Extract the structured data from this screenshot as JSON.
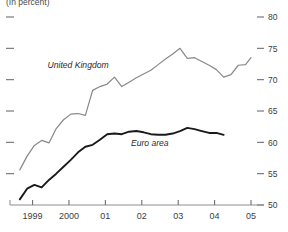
{
  "chart_data": {
    "type": "line",
    "title": "(In percent)",
    "subtitle": "",
    "xlabel": "",
    "ylabel": "",
    "unit_note": "(In percent)",
    "ylim": [
      50,
      80
    ],
    "xlim": [
      1998.6,
      2005.0
    ],
    "grid": false,
    "legend_position": "inline-annotations",
    "y_ticks": [
      50,
      55,
      60,
      65,
      70,
      75,
      80
    ],
    "y_tick_labels": [
      "50",
      "55",
      "60",
      "65",
      "70",
      "75",
      "80"
    ],
    "y_axis_side": "right",
    "y_ticks_mirrored_left": true,
    "x_ticks": [
      1999,
      2000,
      2001,
      2002,
      2003,
      2004,
      2005
    ],
    "x_tick_labels": [
      "1999",
      "2000",
      "01",
      "02",
      "03",
      "04",
      "05"
    ],
    "series": [
      {
        "name": "United Kingdom",
        "color": "#8a8a8a",
        "label_x": 2000.25,
        "label_y": 71.9,
        "x": [
          1998.65,
          1998.85,
          1999.05,
          1999.25,
          1999.45,
          1999.65,
          1999.85,
          2000.05,
          2000.25,
          2000.45,
          2000.65,
          2000.85,
          2001.05,
          2001.25,
          2001.45,
          2001.65,
          2001.85,
          2002.05,
          2002.25,
          2002.45,
          2002.65,
          2002.85,
          2003.05,
          2003.25,
          2003.45,
          2003.65,
          2003.85,
          2004.05,
          2004.25,
          2004.45,
          2004.65,
          2004.85,
          2005.0
        ],
        "values": [
          55.6,
          57.8,
          59.5,
          60.3,
          59.9,
          62.2,
          63.6,
          64.5,
          64.6,
          64.3,
          68.3,
          68.9,
          69.3,
          70.4,
          68.9,
          69.6,
          70.3,
          70.9,
          71.5,
          72.4,
          73.3,
          74.1,
          75.0,
          73.4,
          73.5,
          72.9,
          72.3,
          71.6,
          70.4,
          70.8,
          72.3,
          72.4,
          73.5
        ]
      },
      {
        "name": "Euro area",
        "color": "#1a1a1a",
        "label_x": 2002.22,
        "label_y": 59.4,
        "x": [
          1998.65,
          1998.85,
          1999.05,
          1999.25,
          1999.45,
          1999.65,
          1999.85,
          2000.05,
          2000.25,
          2000.45,
          2000.65,
          2000.85,
          2001.05,
          2001.25,
          2001.45,
          2001.65,
          2001.85,
          2002.05,
          2002.25,
          2002.45,
          2002.65,
          2002.85,
          2003.05,
          2003.25,
          2003.45,
          2003.65,
          2003.85,
          2004.05,
          2004.25
        ],
        "values": [
          50.9,
          52.6,
          53.2,
          52.8,
          54.0,
          55.0,
          56.1,
          57.2,
          58.4,
          59.3,
          59.6,
          60.4,
          61.3,
          61.4,
          61.3,
          61.7,
          61.8,
          61.6,
          61.3,
          61.2,
          61.2,
          61.4,
          61.8,
          62.3,
          62.1,
          61.8,
          61.5,
          61.5,
          61.2
        ]
      }
    ]
  }
}
